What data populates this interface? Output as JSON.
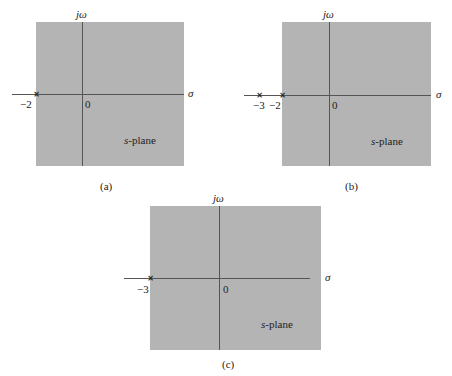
{
  "figure": {
    "panels": [
      {
        "caption": "(a)",
        "vertical_axis_label": "jω",
        "horizontal_axis_label": "σ",
        "origin_label": "0",
        "region_label_italic": "s",
        "region_label_rest": "-plane",
        "poles": [
          {
            "value": -2,
            "label": "−2",
            "marker": "×"
          }
        ],
        "shaded_region": "Re(s) > -2"
      },
      {
        "caption": "(b)",
        "vertical_axis_label": "jω",
        "horizontal_axis_label": "σ",
        "origin_label": "0",
        "region_label_italic": "s",
        "region_label_rest": "-plane",
        "poles": [
          {
            "value": -3,
            "label": "−3",
            "marker": "×"
          },
          {
            "value": -2,
            "label": "−2",
            "marker": "×"
          }
        ],
        "shaded_region": "Re(s) > -2"
      },
      {
        "caption": "(c)",
        "vertical_axis_label": "jω",
        "horizontal_axis_label": "σ",
        "origin_label": "0",
        "region_label_italic": "s",
        "region_label_rest": "-plane",
        "poles": [
          {
            "value": -3,
            "label": "−3",
            "marker": "×"
          }
        ],
        "shaded_region": "Re(s) > -3"
      }
    ],
    "colors": {
      "shade": "#b4b4b4",
      "axis": "#555555",
      "text": "#222222"
    }
  }
}
